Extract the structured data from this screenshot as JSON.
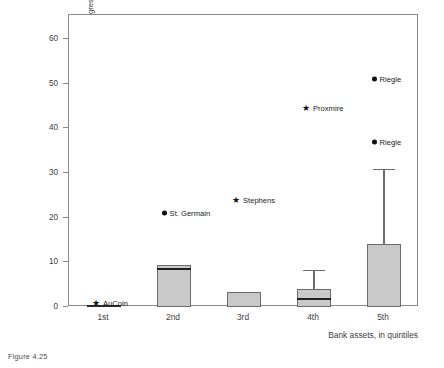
{
  "figure": {
    "caption": "Figure 4.25"
  },
  "chart_data": {
    "type": "box",
    "title": "",
    "xlabel": "Bank assets, in quintiles",
    "ylabel": "Independence of the Fed/relations between Fed, Congress, and administration",
    "categories": [
      "1st",
      "2nd",
      "3rd",
      "4th",
      "5th"
    ],
    "ylim": [
      0,
      65
    ],
    "yticks": [
      0,
      10,
      20,
      30,
      40,
      50,
      60
    ],
    "ytick_labels": [
      "0",
      "10",
      "20",
      "30",
      "40",
      "50",
      "60"
    ],
    "grid": false,
    "legend": "none",
    "boxes": [
      {
        "category": "1st",
        "q1": 0,
        "median": 0.3,
        "q3": 0.5,
        "whisker_low": 0,
        "whisker_high": 0.5
      },
      {
        "category": "2nd",
        "q1": 0,
        "median": 8.5,
        "q3": 9.4,
        "whisker_low": 0,
        "whisker_high": 9.4
      },
      {
        "category": "3rd",
        "q1": 0,
        "median": 0,
        "q3": 3.4,
        "whisker_low": 0,
        "whisker_high": 3.4
      },
      {
        "category": "4th",
        "q1": 0,
        "median": 1.8,
        "q3": 4.0,
        "whisker_low": 0,
        "whisker_high": 8.3
      },
      {
        "category": "5th",
        "q1": 0,
        "median": 0,
        "q3": 14.0,
        "whisker_low": 0,
        "whisker_high": 31.0
      }
    ],
    "annotations": [
      {
        "label": "AuCoin",
        "marker": "star",
        "category": "1st",
        "value": 1.0,
        "label_side": "right"
      },
      {
        "label": "St. Germain",
        "marker": "dot",
        "category": "2nd",
        "value": 21.0,
        "label_side": "right"
      },
      {
        "label": "Stephens",
        "marker": "star",
        "category": "3rd",
        "value": 24.0,
        "label_side": "right"
      },
      {
        "label": "Proxmire",
        "marker": "star",
        "category": "4th",
        "value": 44.5,
        "label_side": "right"
      },
      {
        "label": "Riegle",
        "marker": "dot",
        "category": "5th",
        "value": 51.0,
        "label_side": "right"
      },
      {
        "label": "Riegle",
        "marker": "dot",
        "category": "5th",
        "value": 37.0,
        "label_side": "right"
      }
    ],
    "colors": {
      "box_fill": "#c9c9c9",
      "box_edge": "#6b6b6b",
      "median": "#1f1f1f",
      "frame": "#8a8a8a",
      "marker": "#111111",
      "text": "#3d3d3d",
      "background": "#ffffff"
    }
  }
}
